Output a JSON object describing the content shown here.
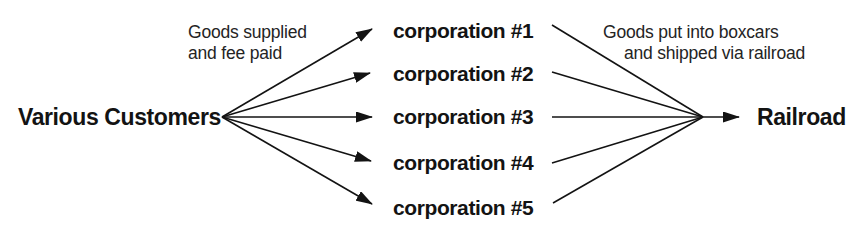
{
  "diagram": {
    "source_node": "Various Customers",
    "corporations": [
      "corporation #1",
      "corporation #2",
      "corporation #3",
      "corporation #4",
      "corporation #5"
    ],
    "destination_node": "Railroad",
    "left_annotation": {
      "line1": "Goods supplied",
      "line2": "and fee paid"
    },
    "right_annotation": {
      "line1": "Goods put into boxcars",
      "line2": "and shipped via railroad"
    },
    "colors": {
      "ink": "#131313",
      "background": "#ffffff"
    }
  }
}
